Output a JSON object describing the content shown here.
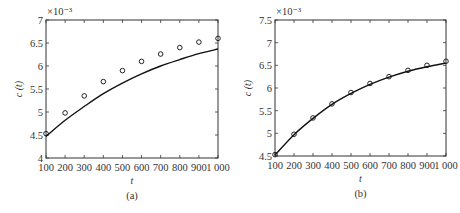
{
  "chart_data": [
    {
      "id": "a",
      "type": "line",
      "caption": "(a)",
      "title": "",
      "xlabel": "t",
      "ylabel": "c (t)",
      "y_multiplier": "×10⁻³",
      "xlim": [
        100,
        1000
      ],
      "ylim": [
        4,
        7
      ],
      "xticks": [
        100,
        200,
        300,
        400,
        500,
        600,
        700,
        800,
        900,
        1000
      ],
      "xtick_labels": [
        "100",
        "200",
        "300",
        "400",
        "500",
        "600",
        "700",
        "800",
        "900",
        "1 000"
      ],
      "yticks": [
        4,
        4.5,
        5,
        5.5,
        6,
        6.5,
        7
      ],
      "ytick_labels": [
        "4",
        "4.5",
        "5",
        "5.5",
        "6",
        "6.5",
        "7"
      ],
      "grid": false,
      "legend": null,
      "x": [
        100,
        200,
        300,
        400,
        500,
        600,
        700,
        800,
        900,
        1000
      ],
      "series": [
        {
          "name": "observed",
          "style": "circle-markers",
          "values": [
            4.53,
            4.98,
            5.35,
            5.66,
            5.9,
            6.1,
            6.26,
            6.4,
            6.52,
            6.6
          ]
        },
        {
          "name": "model",
          "style": "solid-line",
          "values": [
            4.47,
            4.82,
            5.12,
            5.4,
            5.63,
            5.83,
            6.0,
            6.14,
            6.27,
            6.37
          ]
        }
      ],
      "frame": {
        "left": 46,
        "right": 218,
        "top": 20,
        "bottom": 158
      }
    },
    {
      "id": "b",
      "type": "line",
      "caption": "(b)",
      "title": "",
      "xlabel": "t",
      "ylabel": "c (t)",
      "y_multiplier": "×10⁻³",
      "xlim": [
        100,
        1000
      ],
      "ylim": [
        4.5,
        7.5
      ],
      "xticks": [
        100,
        200,
        300,
        400,
        500,
        600,
        700,
        800,
        900,
        1000
      ],
      "xtick_labels": [
        "100",
        "200",
        "300",
        "400",
        "500",
        "600",
        "700",
        "800",
        "900",
        "1 000"
      ],
      "yticks": [
        4.5,
        5,
        5.5,
        6,
        6.5,
        7,
        7.5
      ],
      "ytick_labels": [
        "4.5",
        "5",
        "5.5",
        "6",
        "6.5",
        "7",
        "7.5"
      ],
      "grid": false,
      "legend": null,
      "x": [
        100,
        200,
        300,
        400,
        500,
        600,
        700,
        800,
        900,
        1000
      ],
      "series": [
        {
          "name": "observed",
          "style": "circle-markers",
          "values": [
            4.53,
            4.98,
            5.34,
            5.65,
            5.9,
            6.1,
            6.25,
            6.39,
            6.5,
            6.59
          ]
        },
        {
          "name": "model",
          "style": "solid-line",
          "values": [
            4.52,
            4.97,
            5.33,
            5.64,
            5.88,
            6.08,
            6.24,
            6.37,
            6.47,
            6.55
          ]
        }
      ],
      "frame": {
        "left": 45,
        "right": 216,
        "top": 20,
        "bottom": 156
      }
    }
  ]
}
